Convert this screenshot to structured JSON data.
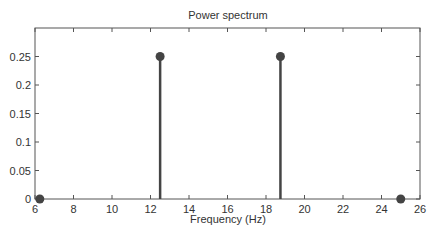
{
  "chart_data": {
    "type": "stem",
    "title": "Power spectrum",
    "xlabel": "Frequency (Hz)",
    "ylabel": "",
    "xlim": [
      6,
      26
    ],
    "ylim": [
      0,
      0.3
    ],
    "xticks": [
      6,
      8,
      10,
      12,
      14,
      16,
      18,
      20,
      22,
      24,
      26
    ],
    "yticks": [
      0,
      0.05,
      0.1,
      0.15,
      0.2,
      0.25
    ],
    "ytick_labels": [
      "0",
      "0.05",
      "0.1",
      "0.15",
      "0.2",
      "0.25"
    ],
    "x": [
      6.25,
      12.5,
      18.75,
      25
    ],
    "values": [
      0,
      0.25,
      0.25,
      0
    ],
    "grid": false,
    "legend": null,
    "color": "#444444"
  }
}
